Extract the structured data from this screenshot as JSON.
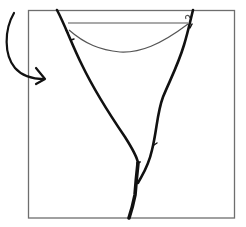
{
  "illustration": {
    "description": "Hand-drawn Y-shaped forked branch with a curved string across its arms, inside a square frame, with a curved arrow pointing into the frame from the left",
    "colors": {
      "background": "#ffffff",
      "frame": "#6e6e6e",
      "branch": "#111111",
      "string": "#555555",
      "arrow": "#111111"
    },
    "elements": [
      "frame",
      "forked-branch",
      "string",
      "curved-arrow"
    ]
  }
}
